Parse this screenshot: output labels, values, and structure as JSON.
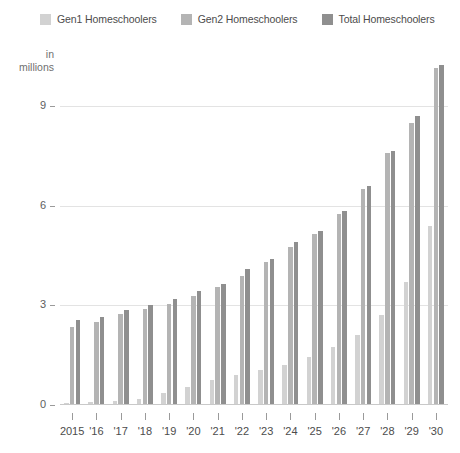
{
  "legend": {
    "position": "top-left",
    "items": [
      {
        "label": "Gen1 Homeschoolers",
        "color": "#d2d2d2",
        "swatch_name": "legend-swatch-gen1"
      },
      {
        "label": "Gen2 Homeschoolers",
        "color": "#b4b4b4",
        "swatch_name": "legend-swatch-gen2"
      },
      {
        "label": "Total Homeschoolers",
        "color": "#8f8f8f",
        "swatch_name": "legend-swatch-total"
      }
    ]
  },
  "axis": {
    "y_unit_line1": "in",
    "y_unit_line2": "millions",
    "y_ticks": [
      "0",
      "3",
      "6",
      "9"
    ],
    "x_labels": [
      "2015",
      "'16",
      "'17",
      "'18",
      "'19",
      "'20",
      "'21",
      "'22",
      "'23",
      "'24",
      "'25",
      "'26",
      "'27",
      "'28",
      "'29",
      "'30"
    ]
  },
  "colors": {
    "gen1": "#d2d2d2",
    "gen2": "#b4b4b4",
    "total": "#8f8f8f",
    "gridline": "#e3e3e3",
    "axis": "#9a9a9a",
    "text": "#4c4c4c",
    "background": "#ffffff"
  },
  "chart_data": {
    "type": "bar",
    "title": "",
    "subtitle": "",
    "xlabel": "",
    "ylabel": "in millions",
    "ylim": [
      0,
      10.4
    ],
    "yticks": [
      0,
      3,
      6,
      9
    ],
    "grid": true,
    "legend_position": "top-left",
    "categories": [
      "2015",
      "'16",
      "'17",
      "'18",
      "'19",
      "'20",
      "'21",
      "'22",
      "'23",
      "'24",
      "'25",
      "'26",
      "'27",
      "'28",
      "'29",
      "'30"
    ],
    "series": [
      {
        "name": "Gen1 Homeschoolers",
        "color": "#d2d2d2",
        "values": [
          0.05,
          0.08,
          0.12,
          0.18,
          0.35,
          0.55,
          0.75,
          0.9,
          1.05,
          1.2,
          1.45,
          1.75,
          2.1,
          2.7,
          3.7,
          5.4
        ]
      },
      {
        "name": "Gen2 Homeschoolers",
        "color": "#b4b4b4",
        "values": [
          2.35,
          2.5,
          2.75,
          2.9,
          3.05,
          3.3,
          3.55,
          3.9,
          4.3,
          4.75,
          5.15,
          5.75,
          6.5,
          7.6,
          8.5,
          10.15
        ]
      },
      {
        "name": "Total Homeschoolers",
        "color": "#8f8f8f",
        "values": [
          2.55,
          2.65,
          2.85,
          3.0,
          3.2,
          3.45,
          3.65,
          4.1,
          4.4,
          4.9,
          5.25,
          5.85,
          6.6,
          7.65,
          8.7,
          10.25
        ]
      }
    ]
  }
}
